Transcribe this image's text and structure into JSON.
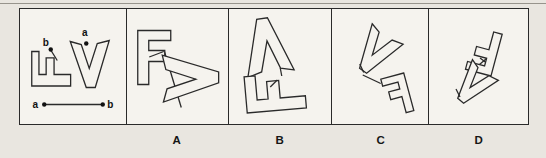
{
  "page": {
    "background": "#e9e6e0",
    "panel_bg": "#f5f3ee",
    "stroke_color": "#2a2a2a",
    "rule_color": "#97948c",
    "label_color": "#161616"
  },
  "options": [
    {
      "label": "A"
    },
    {
      "label": "B"
    },
    {
      "label": "C"
    },
    {
      "label": "D"
    }
  ],
  "point_labels": {
    "a": "a",
    "b": "b"
  },
  "shapes": {
    "F": "M0 0 H33 V10 H11 V20 H27 V31 H11 V54 H0 Z",
    "V": "M0 1 L11 4 L19 28 L27 3 L39 0 L25 47 L16 47 Z"
  },
  "panels": [
    {
      "id": "stem",
      "w": 105,
      "items": [
        {
          "t": "shape",
          "ref": "F",
          "name": "f-shape",
          "tf": "translate(11.5,77) rotate(-90) scale(1.045,0.72)"
        },
        {
          "t": "shape",
          "ref": "V",
          "name": "v-shape",
          "tf": "translate(50,31.5)"
        },
        {
          "t": "line",
          "name": "point-b-leader-line",
          "p": [
            30.5,
            41,
            37,
            51.5
          ]
        },
        {
          "t": "dot",
          "name": "point-b-dot",
          "p": [
            30.5,
            40.5
          ]
        },
        {
          "t": "text",
          "name": "point-b-label",
          "s": "b",
          "p": [
            25.5,
            37
          ]
        },
        {
          "t": "dot",
          "name": "point-a-dot",
          "p": [
            66,
            34.5
          ]
        },
        {
          "t": "text",
          "name": "point-a-label",
          "s": "a",
          "p": [
            64.5,
            27
          ]
        },
        {
          "t": "line",
          "name": "ab-segment",
          "p": [
            24,
            95.5,
            82.5,
            95.5
          ]
        },
        {
          "t": "dot",
          "name": "ab-a-dot",
          "p": [
            24,
            95.5
          ]
        },
        {
          "t": "dot",
          "name": "ab-b-dot",
          "p": [
            82.5,
            95.5
          ]
        },
        {
          "t": "text",
          "name": "ab-a-label",
          "s": "a",
          "p": [
            15,
            99
          ]
        },
        {
          "t": "text",
          "name": "ab-b-label",
          "s": "b",
          "p": [
            90,
            99
          ]
        }
      ]
    },
    {
      "id": "A",
      "w": 101,
      "items": [
        {
          "t": "line",
          "name": "connector-line",
          "p": [
            37,
            42,
            54,
            98.5
          ]
        },
        {
          "t": "shape",
          "ref": "F",
          "name": "f-shape",
          "tf": "translate(10.5,21.5)"
        },
        {
          "t": "line",
          "name": "attach-mark",
          "p": [
            22,
            48,
            36.5,
            42.5
          ]
        },
        {
          "t": "shape",
          "ref": "V",
          "name": "v-shape",
          "tf": "translate(35,93) rotate(-90) scale(1.2)"
        }
      ]
    },
    {
      "id": "B",
      "w": 101,
      "items": [
        {
          "t": "line",
          "name": "connector-line",
          "p": [
            51,
            59,
            52.5,
            67
          ]
        },
        {
          "t": "shape",
          "ref": "V",
          "name": "v-shape",
          "tf": "translate(65,62) rotate(172) scale(1.2)"
        },
        {
          "t": "shape",
          "ref": "F",
          "name": "f-shape",
          "tf": "translate(18,104) rotate(-95) scale(1.1)"
        },
        {
          "t": "line",
          "name": "attach-mark",
          "p": [
            41,
            78,
            48,
            71
          ]
        }
      ]
    },
    {
      "id": "C",
      "w": 96,
      "items": [
        {
          "t": "line",
          "name": "connector-line",
          "p": [
            30.5,
            66,
            48.5,
            74.5
          ]
        },
        {
          "t": "shape",
          "ref": "V",
          "name": "v-shape",
          "tf": "translate(40.5,14) rotate(35) scale(0.95)"
        },
        {
          "t": "line",
          "name": "attach-mark",
          "p": [
            27.5,
            55,
            31.5,
            63.5
          ]
        },
        {
          "t": "shape",
          "ref": "F",
          "name": "f-shape",
          "tf": "translate(71.5,64) rotate(-15) scale(-0.72,0.72)"
        }
      ]
    },
    {
      "id": "D",
      "w": 98,
      "items": [
        {
          "t": "line",
          "name": "connector-line",
          "p": [
            51,
            49,
            63,
            58
          ]
        },
        {
          "t": "shape",
          "ref": "F",
          "name": "f-shape",
          "tf": "translate(62,67) rotate(195) scale(0.8)"
        },
        {
          "t": "line",
          "name": "attach-mark",
          "p": [
            50.5,
            55.5,
            57.5,
            49.5
          ]
        },
        {
          "t": "shape",
          "ref": "V",
          "name": "v-shape",
          "tf": "translate(44,50) rotate(40) scale(0.85)"
        },
        {
          "t": "line",
          "name": "attach-mark-2",
          "p": [
            27,
            80,
            31,
            88
          ]
        }
      ]
    }
  ]
}
